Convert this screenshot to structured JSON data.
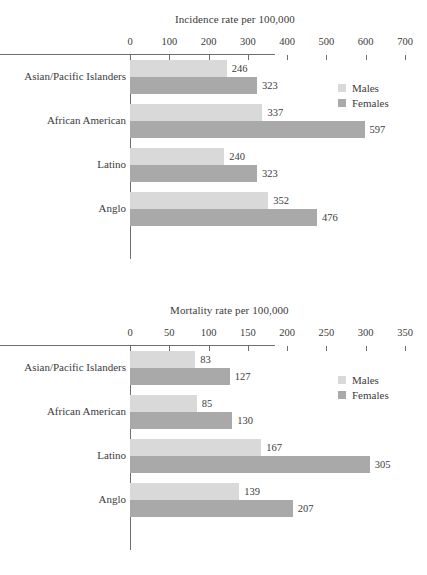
{
  "legend": {
    "males_label": "Males",
    "females_label": "Females",
    "males_color": "#d9d9d9",
    "females_color": "#a9a9a9"
  },
  "charts": [
    {
      "id": "incidence",
      "title": "Incidence rate per 100,000",
      "ticks": [
        "0",
        "100",
        "200",
        "300",
        "400",
        "500",
        "600",
        "700"
      ],
      "categories": [
        "Asian/Pacific Islanders",
        "African American",
        "Latino",
        "Anglo"
      ],
      "males": [
        246,
        337,
        240,
        352
      ],
      "females": [
        323,
        597,
        323,
        476
      ],
      "males_text": [
        "246",
        "337",
        "240",
        "352"
      ],
      "females_text": [
        "323",
        "597",
        "323",
        "476"
      ]
    },
    {
      "id": "mortality",
      "title": "Mortality rate per 100,000",
      "ticks": [
        "0",
        "50",
        "100",
        "150",
        "200",
        "250",
        "300",
        "350"
      ],
      "categories": [
        "Asian/Pacific Islanders",
        "African American",
        "Latino",
        "Anglo"
      ],
      "males": [
        83,
        85,
        167,
        139
      ],
      "females": [
        127,
        130,
        305,
        207
      ],
      "males_text": [
        "83",
        "85",
        "167",
        "139"
      ],
      "females_text": [
        "127",
        "130",
        "305",
        "207"
      ]
    }
  ],
  "chart_data": [
    {
      "type": "bar",
      "orientation": "horizontal",
      "title": "Incidence rate per 100,000",
      "xlabel": "",
      "ylabel": "",
      "xlim": [
        0,
        700
      ],
      "xticks": [
        0,
        100,
        200,
        300,
        400,
        500,
        600,
        700
      ],
      "grid": false,
      "legend_position": "top-right",
      "categories": [
        "Asian/Pacific Islanders",
        "African American",
        "Latino",
        "Anglo"
      ],
      "series": [
        {
          "name": "Males",
          "values": [
            246,
            337,
            240,
            352
          ],
          "color": "#d9d9d9"
        },
        {
          "name": "Females",
          "values": [
            323,
            597,
            323,
            476
          ],
          "color": "#a9a9a9"
        }
      ]
    },
    {
      "type": "bar",
      "orientation": "horizontal",
      "title": "Mortality rate per 100,000",
      "xlabel": "",
      "ylabel": "",
      "xlim": [
        0,
        350
      ],
      "xticks": [
        0,
        50,
        100,
        150,
        200,
        250,
        300,
        350
      ],
      "grid": false,
      "legend_position": "top-right",
      "categories": [
        "Asian/Pacific Islanders",
        "African American",
        "Latino",
        "Anglo"
      ],
      "series": [
        {
          "name": "Males",
          "values": [
            83,
            85,
            167,
            139
          ],
          "color": "#d9d9d9"
        },
        {
          "name": "Females",
          "values": [
            127,
            130,
            305,
            207
          ],
          "color": "#a9a9a9"
        }
      ]
    }
  ]
}
